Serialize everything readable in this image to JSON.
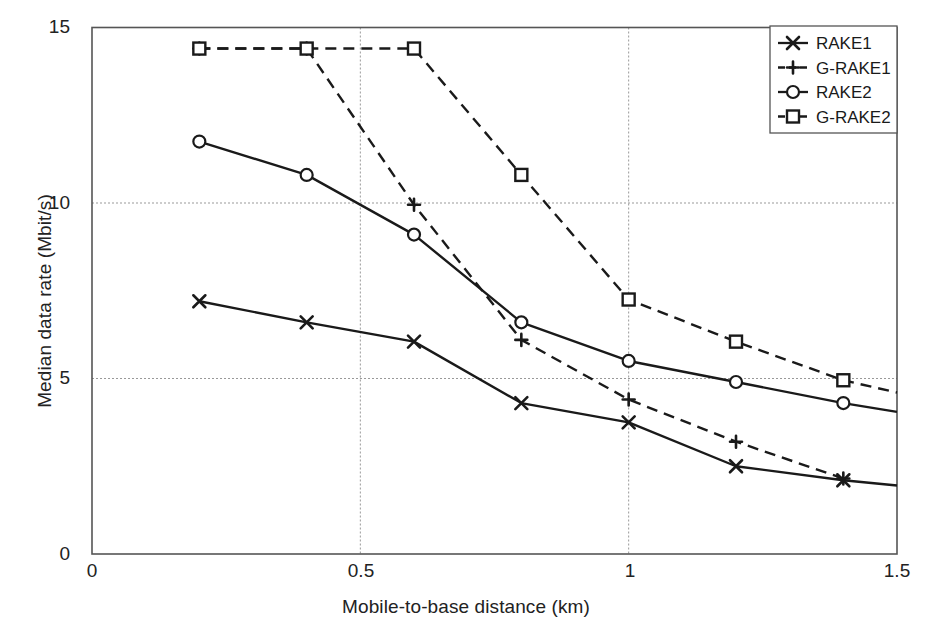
{
  "chart_data": {
    "type": "line",
    "title": "",
    "xlabel": "Mobile-to-base distance (km)",
    "ylabel": "Median data rate (Mbit/s)",
    "xlim": [
      0,
      1.5
    ],
    "ylim": [
      0,
      15
    ],
    "xticks": [
      "0",
      "0.5",
      "1",
      "1.5"
    ],
    "xtick_values": [
      0,
      0.5,
      1,
      1.5
    ],
    "yticks": [
      "0",
      "5",
      "10",
      "15"
    ],
    "ytick_values": [
      0,
      5,
      10,
      15
    ],
    "grid": "dotted gridlines at x=0.5, x=1 and y=5, y=10",
    "legend_position": "top-right",
    "series": [
      {
        "name": "RAKE1",
        "marker": "x",
        "linestyle": "solid",
        "color": "#1a1a1a",
        "x": [
          0.2,
          0.4,
          0.6,
          0.8,
          1.0,
          1.2,
          1.4,
          1.5
        ],
        "values": [
          7.2,
          6.6,
          6.05,
          4.3,
          3.75,
          2.5,
          2.1,
          1.95
        ]
      },
      {
        "name": "G-RAKE1",
        "marker": "plus",
        "linestyle": "dashed",
        "color": "#1a1a1a",
        "x": [
          0.2,
          0.4,
          0.6,
          0.8,
          1.0,
          1.2,
          1.4
        ],
        "values": [
          14.4,
          14.4,
          9.95,
          6.1,
          4.4,
          3.2,
          2.15
        ]
      },
      {
        "name": "RAKE2",
        "marker": "circle",
        "linestyle": "solid",
        "color": "#1a1a1a",
        "x": [
          0.2,
          0.4,
          0.6,
          0.8,
          1.0,
          1.2,
          1.4,
          1.5
        ],
        "values": [
          11.75,
          10.8,
          9.1,
          6.6,
          5.5,
          4.9,
          4.3,
          4.05
        ]
      },
      {
        "name": "G-RAKE2",
        "marker": "square",
        "linestyle": "dashed",
        "color": "#1a1a1a",
        "x": [
          0.2,
          0.4,
          0.6,
          0.8,
          1.0,
          1.2,
          1.4,
          1.5
        ],
        "values": [
          14.4,
          14.4,
          14.4,
          10.8,
          7.25,
          6.05,
          4.95,
          4.6
        ]
      }
    ]
  },
  "legend": {
    "entries": [
      {
        "label": "RAKE1"
      },
      {
        "label": "G-RAKE1"
      },
      {
        "label": "RAKE2"
      },
      {
        "label": "G-RAKE2"
      }
    ]
  },
  "axes": {
    "x_title": "Mobile-to-base distance (km)",
    "y_title": "Median data rate (Mbit/s)",
    "x_tick_labels": [
      "0",
      "0.5",
      "1",
      "1.5"
    ],
    "y_tick_labels": [
      "0",
      "5",
      "10",
      "15"
    ]
  },
  "colors": {
    "ink": "#1a1a1a",
    "axis": "#555555",
    "grid": "#999999",
    "background": "#ffffff"
  }
}
